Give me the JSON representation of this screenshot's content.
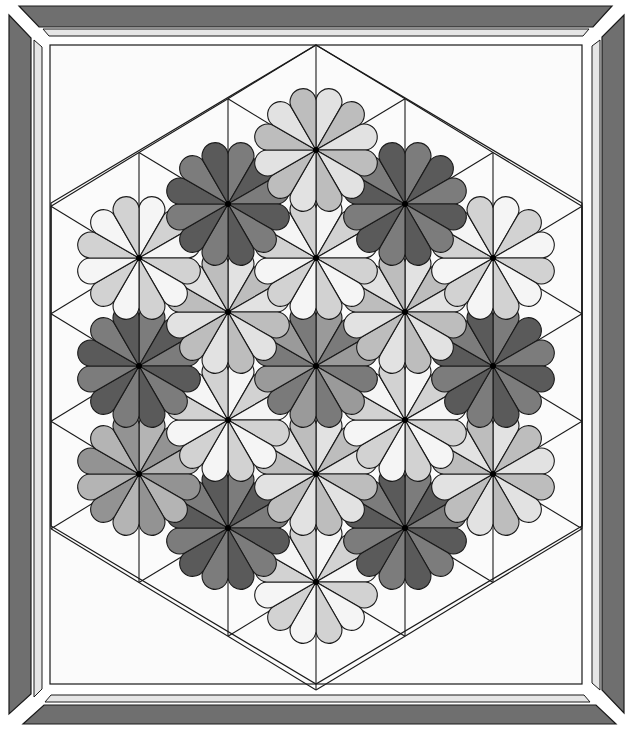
{
  "image": {
    "subject": "Dresden plate hexagon quilt pattern",
    "width": 632,
    "height": 738
  },
  "colors": {
    "background": "#ffffff",
    "frame_dark": "#6f6f6f",
    "frame_light": "#e6e6e6",
    "panel": "#fbfbfb",
    "line": "#1a1a1a"
  },
  "frame": {
    "outer_dark": {
      "top": [
        [
          19,
          6
        ],
        [
          612,
          6
        ],
        [
          593,
          27
        ],
        [
          39,
          27
        ]
      ],
      "right": [
        [
          624,
          15
        ],
        [
          624,
          713
        ],
        [
          602,
          690
        ],
        [
          602,
          37
        ]
      ],
      "bottom": [
        [
          23,
          724
        ],
        [
          616,
          724
        ],
        [
          596,
          705
        ],
        [
          44,
          705
        ]
      ],
      "left": [
        [
          9,
          15
        ],
        [
          31,
          38
        ],
        [
          31,
          694
        ],
        [
          9,
          714
        ]
      ]
    },
    "inner_light": {
      "top": [
        [
          43,
          29
        ],
        [
          589,
          29
        ],
        [
          583,
          36
        ],
        [
          49,
          36
        ]
      ],
      "right": [
        [
          600,
          40
        ],
        [
          600,
          690
        ],
        [
          592,
          683
        ],
        [
          592,
          46
        ]
      ],
      "bottom": [
        [
          45,
          702
        ],
        [
          590,
          702
        ],
        [
          584,
          695
        ],
        [
          51,
          695
        ]
      ],
      "left": [
        [
          34,
          40
        ],
        [
          42,
          47
        ],
        [
          42,
          689
        ],
        [
          34,
          697
        ]
      ]
    },
    "panel": {
      "x": 50,
      "y": 45,
      "w": 532,
      "h": 639
    }
  },
  "hexagon": {
    "vertices": [
      [
        316,
        45
      ],
      [
        582,
        203
      ],
      [
        582,
        526
      ],
      [
        316,
        684
      ],
      [
        51,
        526
      ],
      [
        51,
        203
      ]
    ]
  },
  "lattice": {
    "columns_x": [
      51,
      139,
      228,
      316,
      405,
      493,
      582
    ],
    "row_step": 107.5,
    "half_step": 53.75
  },
  "flower_geometry": {
    "petals": 12,
    "wedge_radius": 52,
    "scallop_center_radius": 50,
    "scallop_radius": 13,
    "center_dot_radius": 3
  },
  "palettes": {
    "light": [
      "#f5f5f5",
      "#d2d2d2"
    ],
    "lightm": [
      "#e2e2e2",
      "#bdbdbd"
    ],
    "medium": [
      "#b4b4b4",
      "#939393"
    ],
    "meddark": [
      "#9a9a9a",
      "#7a7a7a"
    ],
    "dark": [
      "#7c7c7c",
      "#5a5a5a"
    ]
  },
  "flowers": [
    {
      "x": 316,
      "y": 150,
      "palette": "lightm"
    },
    {
      "x": 228,
      "y": 204,
      "palette": "dark"
    },
    {
      "x": 405,
      "y": 204,
      "palette": "dark"
    },
    {
      "x": 139,
      "y": 258,
      "palette": "light"
    },
    {
      "x": 316,
      "y": 258,
      "palette": "light"
    },
    {
      "x": 493,
      "y": 258,
      "palette": "light"
    },
    {
      "x": 228,
      "y": 312,
      "palette": "lightm"
    },
    {
      "x": 405,
      "y": 312,
      "palette": "lightm"
    },
    {
      "x": 139,
      "y": 366,
      "palette": "dark"
    },
    {
      "x": 316,
      "y": 366,
      "palette": "meddark"
    },
    {
      "x": 493,
      "y": 366,
      "palette": "dark"
    },
    {
      "x": 228,
      "y": 420,
      "palette": "light"
    },
    {
      "x": 405,
      "y": 420,
      "palette": "light"
    },
    {
      "x": 139,
      "y": 474,
      "palette": "medium"
    },
    {
      "x": 316,
      "y": 474,
      "palette": "lightm"
    },
    {
      "x": 493,
      "y": 474,
      "palette": "lightm"
    },
    {
      "x": 228,
      "y": 528,
      "palette": "dark"
    },
    {
      "x": 405,
      "y": 528,
      "palette": "dark"
    },
    {
      "x": 316,
      "y": 582,
      "palette": "light"
    }
  ]
}
